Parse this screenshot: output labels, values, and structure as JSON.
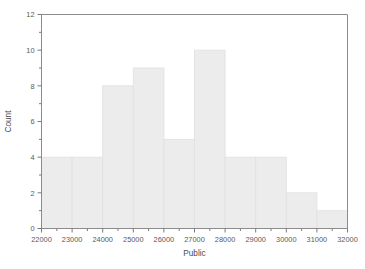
{
  "chart_data": {
    "type": "bar",
    "title": "",
    "subtitle": "",
    "xlabel": "Public",
    "ylabel": "Count",
    "bin_width": 1000,
    "bin_edges": [
      22000,
      23000,
      24000,
      25000,
      26000,
      27000,
      28000,
      29000,
      30000,
      31000,
      32000
    ],
    "categories": [
      "22000-23000",
      "23000-24000",
      "24000-25000",
      "25000-26000",
      "26000-27000",
      "27000-28000",
      "28000-29000",
      "29000-30000",
      "30000-31000",
      "31000-32000"
    ],
    "values": [
      4,
      4,
      8,
      9,
      5,
      10,
      4,
      4,
      2,
      1
    ],
    "xlim": [
      22000,
      32000
    ],
    "ylim": [
      0,
      12
    ],
    "x_major_ticks": [
      22000,
      23000,
      24000,
      25000,
      26000,
      27000,
      28000,
      29000,
      30000,
      31000,
      32000
    ],
    "x_tick_labels": [
      "22000",
      "23000",
      "24000",
      "25000",
      "26000",
      "27000",
      "28000",
      "29000",
      "30000",
      "31000",
      "32000"
    ],
    "x_minor_ticks": [
      22500,
      23500,
      24500,
      25500,
      26500,
      27500,
      28500,
      29500,
      30500,
      31500
    ],
    "y_major_ticks": [
      0,
      2,
      4,
      6,
      8,
      10,
      12
    ],
    "y_tick_labels": [
      "0",
      "2",
      "4",
      "6",
      "8",
      "10",
      "12"
    ],
    "y_minor_ticks": [
      1,
      3,
      5,
      7,
      9,
      11
    ],
    "grid": false,
    "legend": false,
    "legend_position": "none",
    "colors": {
      "bar_fill": "#ececec",
      "bar_border": "#e2e2e2",
      "axis_line": "#8c8c8c",
      "tick_mark": "#7a7a7a",
      "tick_text": "#5a5a5a",
      "axis_title_text": "#4a4a4a",
      "background": "#ffffff"
    }
  }
}
